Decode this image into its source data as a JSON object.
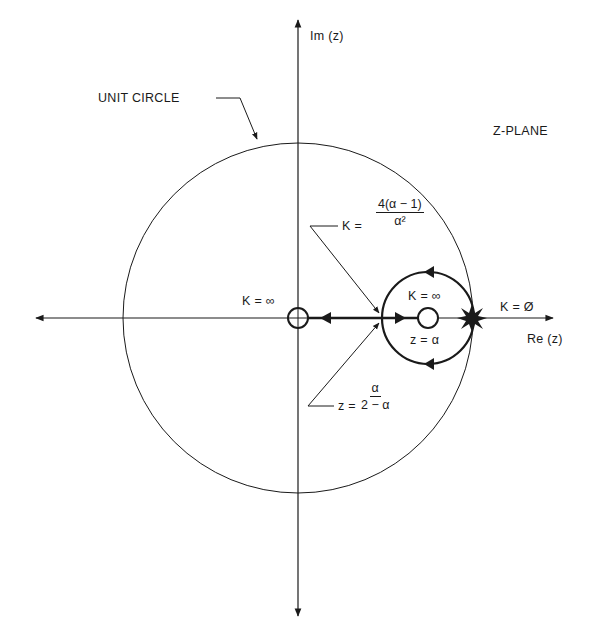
{
  "diagram": {
    "title": "Z-PLANE",
    "axes": {
      "real_label": "Re (z)",
      "imag_label": "Im (z)"
    },
    "unit_circle_label": "UNIT CIRCLE",
    "labels": {
      "k_inf_origin": "K = ∞",
      "k_inf_zero": "K = ∞",
      "k_zero": "K = Ø",
      "z_alpha": "z = α",
      "breakin_k_prefix": "K =",
      "breakin_k_numerator": "4(α − 1)",
      "breakin_k_denominator": "α²",
      "breakin_z_prefix": "z =",
      "breakin_z_numerator": "α",
      "breakin_z_denominator": "2 − α"
    },
    "colors": {
      "line": "#1a1a1a",
      "background": "#ffffff"
    }
  }
}
